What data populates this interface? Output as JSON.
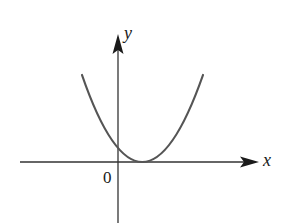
{
  "diagram": {
    "type": "function-graph",
    "axes": {
      "x_label": "x",
      "y_label": "y",
      "origin_label": "0"
    },
    "curve": {
      "kind": "parabola",
      "opens": "up",
      "vertex_on_x_axis": true,
      "vertex_position": "positive x",
      "y_intercept": "positive",
      "color": "#555555"
    },
    "colors": {
      "axis": "#333333",
      "curve": "#555555",
      "text": "#1a1a1a",
      "background": "#ffffff"
    }
  }
}
